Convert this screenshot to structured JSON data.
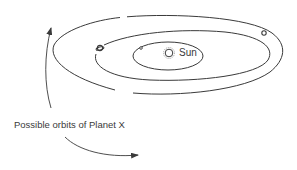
{
  "diagram": {
    "type": "solar-system-orbits",
    "labels": {
      "sun": "Sun",
      "caption": "Possible orbits of Planet X"
    },
    "colors": {
      "line": "#3a3a3a",
      "background": "#ffffff"
    },
    "bodies": [
      {
        "name": "sun",
        "icon": "sun-icon",
        "x": 169,
        "y": 53
      },
      {
        "name": "inner-planet",
        "icon": "planet-dot-icon",
        "x": 141,
        "y": 48
      },
      {
        "name": "ringed-planet",
        "icon": "ringed-planet-icon",
        "x": 100,
        "y": 48
      },
      {
        "name": "outer-planet",
        "icon": "planet-icon",
        "x": 264,
        "y": 33
      }
    ],
    "orbits": [
      {
        "name": "inner-orbit",
        "cx": 168,
        "cy": 56,
        "rx": 35,
        "ry": 14
      },
      {
        "name": "middle-orbit",
        "cx": 183,
        "cy": 56,
        "rx": 88,
        "ry": 27
      },
      {
        "name": "outer-orbit",
        "cx": 175,
        "cy": 55,
        "rx": 122,
        "ry": 40
      }
    ],
    "arrows": [
      {
        "name": "planet-x-orbit-arrow-up",
        "direction": "up"
      },
      {
        "name": "planet-x-orbit-arrow-right",
        "direction": "right"
      }
    ]
  }
}
